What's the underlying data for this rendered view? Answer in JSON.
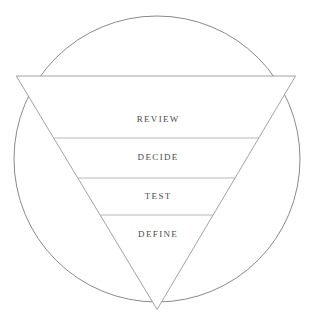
{
  "diagram": {
    "type": "inverted-funnel-in-circle",
    "title": "",
    "circle": {
      "center_x": 157,
      "center_y": 159,
      "radius": 143,
      "stroke_color": "#8a8a8a",
      "stroke_width": 1,
      "fill": "none"
    },
    "triangle": {
      "shape": "inverted",
      "vertices": [
        {
          "x": 34,
          "y": 86
        },
        {
          "x": 278,
          "y": 86
        },
        {
          "x": 157,
          "y": 290
        }
      ],
      "band_color": "#bdbdbd",
      "band_stroke_color": "#8a8a8a",
      "band_width": 10,
      "interior_fill": "#ffffff"
    },
    "divider_color": "#b0b0b0",
    "dividers_y": [
      138,
      178,
      215
    ],
    "stages": [
      {
        "label": "REVIEW",
        "order": 1,
        "center_y": 120,
        "band_top": 97,
        "band_bottom": 138
      },
      {
        "label": "DECIDE",
        "order": 2,
        "center_y": 158,
        "band_top": 138,
        "band_bottom": 178
      },
      {
        "label": "TEST",
        "order": 3,
        "center_y": 197,
        "band_top": 178,
        "band_bottom": 215
      },
      {
        "label": "DEFINE",
        "order": 4,
        "center_y": 235,
        "band_top": 215,
        "band_bottom": 255
      }
    ]
  },
  "colors": {
    "background": "#ffffff",
    "outline": "#8a8a8a",
    "band_fill": "#bdbdbd",
    "text": "#4a4a4a",
    "divider": "#b0b0b0"
  }
}
